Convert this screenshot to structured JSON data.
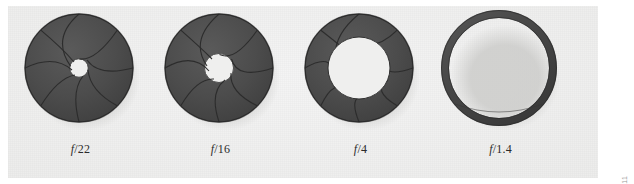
{
  "figure": {
    "kind": "photograph",
    "panel_color": "#ececeb",
    "page_background": "#ffffff",
    "blade_color": "#4a4a4a",
    "blade_edge_color": "#2e2e2e",
    "opening_color": "#f0f0ef",
    "shadow_color": "#cfcfcd"
  },
  "apertures": [
    {
      "id": "aperture-f22",
      "label_f": "f",
      "label_value": "/22",
      "label": "f/22",
      "f_number": 22,
      "opening_ratio": 0.17,
      "blade_count": 8,
      "description": "nearly closed diaphragm, very small opening"
    },
    {
      "id": "aperture-f16",
      "label_f": "f",
      "label_value": "/16",
      "label": "f/16",
      "f_number": 16,
      "opening_ratio": 0.26,
      "blade_count": 8,
      "description": "small opening"
    },
    {
      "id": "aperture-f4",
      "label_f": "f",
      "label_value": "/4",
      "label": "f/4",
      "f_number": 4,
      "opening_ratio": 0.56,
      "blade_count": 8,
      "description": "wide opening"
    },
    {
      "id": "aperture-f1_4",
      "label_f": "f",
      "label_value": "/1.4",
      "label": "f/1.4",
      "f_number": 1.4,
      "opening_ratio": 0.86,
      "blade_count": 8,
      "description": "fully open diaphragm, blades retracted into thin ring"
    }
  ],
  "credit": {
    "text": "© Cengage Learning 2011"
  }
}
